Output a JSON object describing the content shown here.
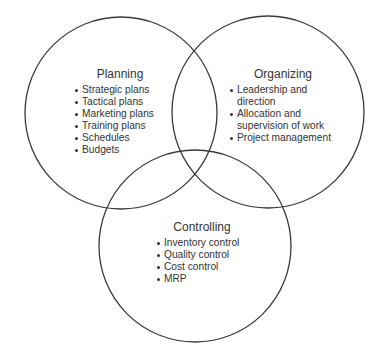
{
  "diagram": {
    "type": "venn",
    "colors": {
      "stroke": "#3a3a3a",
      "background": "#ffffff",
      "text": "#333333"
    },
    "sets": [
      {
        "id": "planning",
        "title": "Planning",
        "items": [
          "Strategic plans",
          "Tactical plans",
          "Marketing plans",
          "Training plans",
          "Schedules",
          "Budgets"
        ]
      },
      {
        "id": "organizing",
        "title": "Organizing",
        "items": [
          "Leadership and direction",
          "Allocation and supervision of work",
          "Project management"
        ]
      },
      {
        "id": "controlling",
        "title": "Controlling",
        "items": [
          "Inventory control",
          "Quality control",
          "Cost control",
          "MRP"
        ]
      }
    ],
    "organizing_display_lines": [
      [
        "Leadership and",
        "direction"
      ],
      [
        "Allocation and",
        "supervision of work"
      ],
      [
        "Project management"
      ]
    ]
  }
}
